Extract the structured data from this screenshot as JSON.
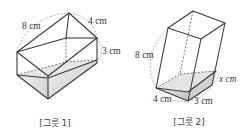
{
  "figure1": {
    "caption": "[그릇 1]",
    "labels": {
      "length": "8 cm",
      "width": "4 cm",
      "height": "3 cm"
    }
  },
  "figure2": {
    "caption": "[그릇 2]",
    "labels": {
      "height": "8 cm",
      "base_left": "4 cm",
      "base_right": "3 cm",
      "water_height": "x cm"
    }
  },
  "colors": {
    "water_light": "#eeeeee",
    "water_dark": "#c9c9c9",
    "edge": "#3a3a3a"
  }
}
